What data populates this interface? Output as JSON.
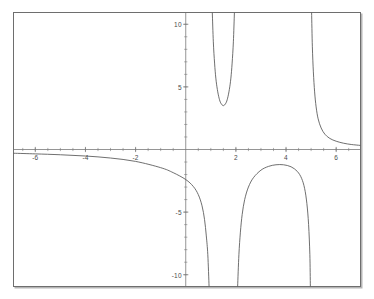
{
  "figure": {
    "background": "#ffffff",
    "frame_color": "#6e6e6e",
    "curve_color": "#555555",
    "axis_color": "#7a7a7a",
    "label_color": "#4a4a4a"
  },
  "chart_data": {
    "type": "line",
    "title": "",
    "subtitle": "",
    "xlabel": "",
    "ylabel": "",
    "grid": false,
    "legend": null,
    "xlim": [
      -6.85,
      6.95
    ],
    "ylim": [
      -10.9,
      10.9
    ],
    "xticks": [
      -6,
      -4,
      -2,
      2,
      4,
      6
    ],
    "xtick_labels": [
      "-6",
      "-4",
      "-2",
      "2",
      "4",
      "6"
    ],
    "yticks": [
      -10,
      -5,
      5,
      10
    ],
    "ytick_labels": [
      "-10",
      "-5",
      "5",
      "10"
    ],
    "xtick_minor_step": 0.5,
    "ytick_minor_step": 1,
    "vertical_asymptotes": [
      1,
      2,
      5
    ],
    "horizontal_asymptote": 0,
    "branch_minimum": {
      "x": 1.5,
      "y": 3.5
    },
    "series": [
      {
        "name": "curve",
        "branches": [
          {
            "name": "left-branch",
            "domain": [
              -6.85,
              1
            ],
            "description": "approaches 0 from below at far left, falls to -infinity as x approaches 1 from the left",
            "points": [
              [
                -6.85,
                -0.3
              ],
              [
                -6.0,
                -0.35
              ],
              [
                -5.0,
                -0.42
              ],
              [
                -4.0,
                -0.52
              ],
              [
                -3.0,
                -0.68
              ],
              [
                -2.0,
                -0.95
              ],
              [
                -1.0,
                -1.45
              ],
              [
                -0.5,
                -1.85
              ],
              [
                0.0,
                -2.4
              ],
              [
                0.3,
                -2.95
              ],
              [
                0.5,
                -3.6
              ],
              [
                0.65,
                -4.5
              ],
              [
                0.75,
                -5.6
              ],
              [
                0.82,
                -6.9
              ],
              [
                0.88,
                -8.4
              ],
              [
                0.93,
                -10.9
              ]
            ]
          },
          {
            "name": "middle-u-branch",
            "domain": [
              1,
              2
            ],
            "description": "U shaped branch between x=1 and x=2 with minimum near (1.5, 3.5)",
            "points": [
              [
                1.06,
                10.9
              ],
              [
                1.1,
                8.6
              ],
              [
                1.15,
                6.9
              ],
              [
                1.2,
                5.7
              ],
              [
                1.26,
                4.8
              ],
              [
                1.33,
                4.1
              ],
              [
                1.4,
                3.7
              ],
              [
                1.5,
                3.5
              ],
              [
                1.6,
                3.7
              ],
              [
                1.67,
                4.1
              ],
              [
                1.74,
                4.8
              ],
              [
                1.8,
                5.7
              ],
              [
                1.85,
                6.9
              ],
              [
                1.9,
                8.6
              ],
              [
                1.94,
                10.9
              ]
            ]
          },
          {
            "name": "right-lower-branch",
            "domain": [
              2,
              5
            ],
            "description": "rises from -infinity at x=2 toward 0 from below, then falls to -infinity at x=5",
            "points": [
              [
                2.07,
                -10.9
              ],
              [
                2.12,
                -8.4
              ],
              [
                2.18,
                -6.6
              ],
              [
                2.25,
                -5.2
              ],
              [
                2.35,
                -4.0
              ],
              [
                2.5,
                -3.0
              ],
              [
                2.7,
                -2.25
              ],
              [
                3.0,
                -1.65
              ],
              [
                3.3,
                -1.35
              ],
              [
                3.6,
                -1.22
              ],
              [
                3.9,
                -1.22
              ],
              [
                4.2,
                -1.38
              ],
              [
                4.45,
                -1.75
              ],
              [
                4.62,
                -2.3
              ],
              [
                4.74,
                -3.1
              ],
              [
                4.83,
                -4.3
              ],
              [
                4.9,
                -6.0
              ],
              [
                4.95,
                -8.4
              ],
              [
                4.97,
                -10.9
              ]
            ]
          },
          {
            "name": "far-right-branch",
            "domain": [
              5,
              6.95
            ],
            "description": "descends from +infinity at x=5 and decays toward 0 from above",
            "points": [
              [
                5.02,
                10.9
              ],
              [
                5.05,
                8.2
              ],
              [
                5.09,
                6.2
              ],
              [
                5.14,
                4.6
              ],
              [
                5.2,
                3.4
              ],
              [
                5.28,
                2.45
              ],
              [
                5.4,
                1.72
              ],
              [
                5.55,
                1.22
              ],
              [
                5.75,
                0.88
              ],
              [
                6.0,
                0.66
              ],
              [
                6.3,
                0.5
              ],
              [
                6.6,
                0.4
              ],
              [
                6.95,
                0.33
              ]
            ]
          }
        ]
      }
    ]
  }
}
